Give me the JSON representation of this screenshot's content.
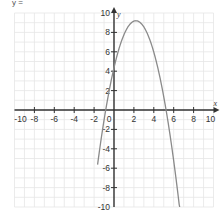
{
  "header_fragment": "y =",
  "chart_data": {
    "type": "line",
    "title": "",
    "xlabel": "x",
    "ylabel": "y",
    "xlim": [
      -10,
      10
    ],
    "ylim": [
      -10,
      10
    ],
    "grid": true,
    "x_ticks": [
      -10,
      -8,
      -6,
      -4,
      -2,
      0,
      2,
      4,
      6,
      8,
      10
    ],
    "y_ticks": [
      -10,
      -8,
      -6,
      -4,
      -2,
      2,
      4,
      6,
      8,
      10
    ],
    "x_tick_labels": [
      "-10",
      "-8",
      "-6",
      "-4",
      "-2",
      "0",
      "2",
      "4",
      "6",
      "8",
      "10"
    ],
    "y_tick_labels": [
      "-10",
      "-8",
      "-6",
      "-4",
      "-2",
      "2",
      "4",
      "6",
      "8",
      "10"
    ],
    "series": [
      {
        "name": "parabola",
        "description": "downward-opening parabola",
        "vertex": [
          2.2,
          9.2
        ],
        "roots": [
          -0.85,
          5.25
        ],
        "y_intercept": 4.4,
        "equation_estimate": "y = -(x - 2.2)^2 + 9.2",
        "color": "#8a8a8a",
        "x": [
          -1.6,
          -1,
          0,
          1,
          2,
          2.2,
          3,
          4,
          5,
          6,
          6.6
        ],
        "y": [
          -5.24,
          -1.04,
          4.36,
          7.76,
          9.16,
          9.2,
          8.56,
          5.96,
          1.36,
          -5.24,
          -10.16
        ]
      }
    ],
    "legend": null
  },
  "colors": {
    "grid": "#e6e6e6",
    "axis": "#333333",
    "curve": "#8a8a8a",
    "background": "#ffffff"
  }
}
